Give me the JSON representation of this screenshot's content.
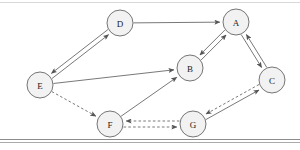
{
  "diagram": {
    "background_color": "#ffffff",
    "node_fill": "#f2f2f2",
    "node_stroke": "#666666",
    "edge_color": "#555555",
    "label_color": "#1a1a1a",
    "rules": {
      "top_color": "#d8d8d8",
      "bottom_color_a": "#8c8c8c",
      "bottom_color_b": "#aaaaaa"
    },
    "nodes": [
      {
        "id": "A",
        "label": "A",
        "x": 236,
        "y": 22,
        "r": 13
      },
      {
        "id": "B",
        "label": "B",
        "x": 190,
        "y": 68,
        "r": 13
      },
      {
        "id": "C",
        "label": "C",
        "x": 272,
        "y": 80,
        "r": 13
      },
      {
        "id": "D",
        "label": "D",
        "x": 120,
        "y": 23,
        "r": 13
      },
      {
        "id": "E",
        "label": "E",
        "x": 40,
        "y": 85,
        "r": 13
      },
      {
        "id": "F",
        "label": "F",
        "x": 110,
        "y": 124,
        "r": 13
      },
      {
        "id": "G",
        "label": "G",
        "x": 193,
        "y": 124,
        "r": 13
      }
    ],
    "edges": [
      {
        "from": "D",
        "to": "A",
        "style": "solid",
        "arrow": "forward",
        "offset": 0
      },
      {
        "from": "E",
        "to": "D",
        "style": "solid",
        "arrow": "forward",
        "offset": 2.2
      },
      {
        "from": "D",
        "to": "E",
        "style": "solid",
        "arrow": "forward",
        "offset": 2.2
      },
      {
        "from": "E",
        "to": "B",
        "style": "solid",
        "arrow": "forward",
        "offset": 0
      },
      {
        "from": "B",
        "to": "A",
        "style": "solid",
        "arrow": "forward",
        "offset": 2.2
      },
      {
        "from": "A",
        "to": "B",
        "style": "solid",
        "arrow": "forward",
        "offset": 2.2
      },
      {
        "from": "A",
        "to": "C",
        "style": "solid",
        "arrow": "forward",
        "offset": 2.2
      },
      {
        "from": "C",
        "to": "A",
        "style": "solid",
        "arrow": "forward",
        "offset": 2.2
      },
      {
        "from": "E",
        "to": "F",
        "style": "dashed",
        "arrow": "forward",
        "offset": 0
      },
      {
        "from": "F",
        "to": "B",
        "style": "solid",
        "arrow": "forward",
        "offset": 0
      },
      {
        "from": "G",
        "to": "F",
        "style": "dashed",
        "arrow": "forward",
        "offset": 3.0
      },
      {
        "from": "F",
        "to": "G",
        "style": "dashed",
        "arrow": "forward",
        "offset": 3.0
      },
      {
        "from": "G",
        "to": "C",
        "style": "solid",
        "arrow": "forward",
        "offset": 2.4
      },
      {
        "from": "C",
        "to": "G",
        "style": "dashed",
        "arrow": "forward",
        "offset": 2.4
      }
    ]
  }
}
